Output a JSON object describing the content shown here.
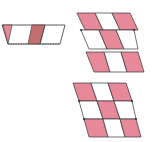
{
  "diagram": {
    "colors": {
      "pink": "#e8899a",
      "dark_pink": "#c2706e",
      "white": "#ffffff",
      "stroke": "#333333",
      "dash": "#777777"
    },
    "figures": [
      {
        "name": "strip-left",
        "cells": 3
      },
      {
        "name": "grid-top-right",
        "rows": 2,
        "cols": 3,
        "extra_strip": 3
      },
      {
        "name": "grid-bottom-right",
        "rows": 3,
        "cols": 3
      }
    ]
  }
}
